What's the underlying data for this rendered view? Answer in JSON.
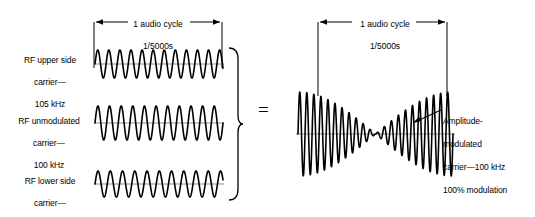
{
  "figure": {
    "background_color": "#ffffff",
    "ink_color": "#000000",
    "baseline_color": "#8c8c8c"
  },
  "left_group": {
    "dimension": {
      "line1": "1 audio cycle",
      "line2": "1/5000s"
    },
    "waveforms": [
      {
        "id": "rf-upper-side-carrier",
        "label": "RF upper side\ncarrier—\n105 kHz",
        "label_line1": "RF upper side",
        "label_line2": "carrier—",
        "label_line3": "105 kHz",
        "frequency_khz": 105,
        "cycles": 11.55,
        "amplitude": 14
      },
      {
        "id": "rf-unmodulated-carrier",
        "label": "RF unmodulated\ncarrier—\n100 kHz",
        "label_line1": "RF unmodulated",
        "label_line2": "carrier—",
        "label_line3": "100 kHz",
        "frequency_khz": 100,
        "cycles": 11.0,
        "amplitude": 17
      },
      {
        "id": "rf-lower-side-carrier",
        "label": "RF lower side\ncarrier—\n95 kHz",
        "label_line1": "RF lower side",
        "label_line2": "carrier—",
        "label_line3": "95 kHz",
        "frequency_khz": 95,
        "cycles": 10.45,
        "amplitude": 13
      }
    ],
    "brace": "right-curly-brace"
  },
  "equals": {
    "symbol": "="
  },
  "right_group": {
    "dimension": {
      "line1": "1 audio cycle",
      "line2": "1/5000s"
    },
    "waveform": {
      "id": "amplitude-modulated-carrier",
      "carrier_cycles": 22,
      "modulation_percent": 100,
      "envelope": "cosine-full-depth"
    },
    "annotation": {
      "line1": "Amplitude-",
      "line2": "modulated",
      "line3": "carrier—100 kHz",
      "line4": "100% modulation",
      "full": "Amplitude-\nmodulated\ncarrier—100 kHz\n100% modulation"
    }
  },
  "chart_data": {
    "type": "line",
    "xlabel": "",
    "ylabel": "",
    "series": [
      {
        "name": "RF upper side carrier — 105 kHz",
        "frequency_khz": 105,
        "amplitude": 0.5,
        "cycles_per_audio_cycle": 11.55
      },
      {
        "name": "RF unmodulated carrier — 100 kHz",
        "frequency_khz": 100,
        "amplitude": 1.0,
        "cycles_per_audio_cycle": 11.0
      },
      {
        "name": "RF lower side carrier — 95 kHz",
        "frequency_khz": 95,
        "amplitude": 0.5,
        "cycles_per_audio_cycle": 10.45
      },
      {
        "name": "Amplitude-modulated carrier — 100 kHz, 100% modulation",
        "frequency_khz": 100,
        "modulation_percent": 100,
        "cycles_per_audio_cycle": 22
      }
    ],
    "annotations": [
      "1 audio cycle",
      "1/5000s",
      "="
    ],
    "audio_cycle_period_s": "1/5000",
    "audio_frequency_hz": 5000,
    "grid": false,
    "legend": "none"
  }
}
